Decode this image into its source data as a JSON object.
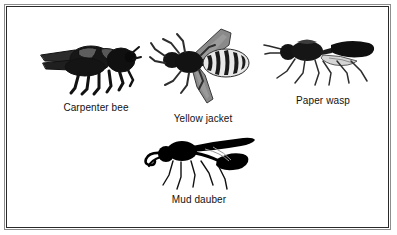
{
  "figure": {
    "background_color": "#ffffff",
    "frame_color": "#2a2a2a",
    "frame_outer_color": "#8d8d8d",
    "ink_color": "#111111",
    "label_color": "#111111"
  },
  "specimens": [
    {
      "label": "Carpenter bee",
      "icon": "carpenter-bee-illustration",
      "view": "side view facing right",
      "description": "Stout hairy bee, black body with broad dark wings folded over the back and six legs hanging below",
      "body_color": "#121212",
      "wing_color": "#3f3f3f"
    },
    {
      "label": "Yellow jacket",
      "icon": "yellow-jacket-illustration",
      "view": "top-down dorsal view",
      "description": "Wasp seen from above with two long wings spread and a banded striped abdomen",
      "body_color": "#141414",
      "wing_color": "#6e6e6e",
      "stripe_color": "#1a1a1a"
    },
    {
      "label": "Paper wasp",
      "icon": "paper-wasp-illustration",
      "view": "side view facing left",
      "description": "Slender wasp with long dangling legs, narrow waist and a dark elongated pointed abdomen",
      "body_color": "#131313",
      "wing_color": "#5a5a5a"
    },
    {
      "label": "Mud dauber",
      "icon": "mud-dauber-illustration",
      "view": "side view facing left",
      "description": "Solid black silhouette wasp with curled antennae, a long narrow wing raised over the back and thread-like legs",
      "body_color": "#000000",
      "wing_color": "#000000"
    }
  ]
}
